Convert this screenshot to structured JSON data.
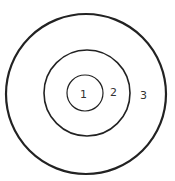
{
  "diagram": {
    "type": "concentric-circles",
    "center": {
      "x": 86,
      "y": 94
    },
    "rings": [
      {
        "label": "1",
        "radius": 18,
        "stroke_width": 1.2,
        "label_pos": {
          "x": 83,
          "y": 98
        }
      },
      {
        "label": "2",
        "radius": 43,
        "stroke_width": 1.6,
        "label_pos": {
          "x": 114,
          "y": 96
        }
      },
      {
        "label": "3",
        "radius": 80,
        "stroke_width": 2.2,
        "label_pos": {
          "x": 144,
          "y": 99
        }
      }
    ],
    "stroke_color": "#222222",
    "label_color": "#333333"
  }
}
